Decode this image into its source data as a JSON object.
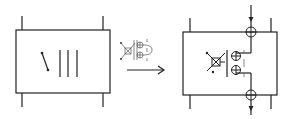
{
  "diagram": {
    "colors": {
      "stroke": "#222222",
      "background": "#ffffff"
    },
    "left_block": {
      "elements": [
        "switch-symbol",
        "bar",
        "bar",
        "bar"
      ]
    },
    "transform": {
      "icon": "switch-junction-icon",
      "arrow": "right-arrow-icon"
    },
    "right_block": {
      "elements": [
        "cross-switch-symbol",
        "junction-circle",
        "junction-circle",
        "junction-circle",
        "junction-circle",
        "through-line"
      ]
    }
  }
}
